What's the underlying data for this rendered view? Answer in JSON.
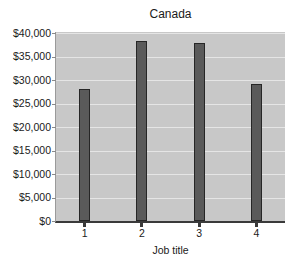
{
  "chart_data": {
    "type": "bar",
    "title": "Canada",
    "xlabel": "Job title",
    "ylabel": "",
    "categories": [
      "1",
      "2",
      "3",
      "4"
    ],
    "values": [
      28000,
      38200,
      37800,
      29200
    ],
    "ylim": [
      0,
      40000
    ],
    "ytick_step": 5000,
    "y_tick_labels": [
      "$0",
      "$5,000",
      "$10,000",
      "$15,000",
      "$20,000",
      "$25,000",
      "$30,000",
      "$35,000",
      "$40,000"
    ],
    "grid": true,
    "legend": false,
    "colors": {
      "page_bg": "#ffffff",
      "plot_bg": "#c8c8c8",
      "gridline": "#e5e5e5",
      "bar_fill": "#5a5a5a",
      "bar_border": "#262626",
      "axis_line": "#3a3a3a",
      "y_axis_edge": "#9a9a9a",
      "tick": "#8a8a8a",
      "text": "#1a1a1a"
    }
  }
}
